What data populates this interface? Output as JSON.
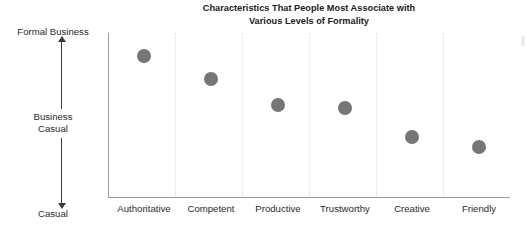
{
  "chart_data": {
    "type": "scatter",
    "title": "Characteristics That People Most Associate with\nVarious Levels of Formality",
    "xlabel": "",
    "ylabel": "",
    "categories": [
      "Authoritative",
      "Competent",
      "Productive",
      "Trustworthy",
      "Creative",
      "Friendly"
    ],
    "values": [
      0.855,
      0.715,
      0.558,
      0.54,
      0.364,
      0.303
    ],
    "y_axis": {
      "type": "ordinal-scale",
      "top_label": "Formal Business",
      "middle_label": "Business\nCasual",
      "bottom_label": "Casual",
      "ticks": [],
      "ylim": [
        0,
        1
      ]
    },
    "grid": {
      "vertical": true,
      "horizontal": false,
      "style": "dotted",
      "count": 5
    },
    "legend": {
      "visible": false,
      "position": "none"
    },
    "marker": {
      "shape": "circle",
      "color": "#767676",
      "size_px": 14
    },
    "series": [
      {
        "name": "Formality level",
        "points": [
          {
            "category": "Authoritative",
            "value": 0.855
          },
          {
            "category": "Competent",
            "value": 0.715
          },
          {
            "category": "Productive",
            "value": 0.558
          },
          {
            "category": "Trustworthy",
            "value": 0.54
          },
          {
            "category": "Creative",
            "value": 0.364
          },
          {
            "category": "Friendly",
            "value": 0.303
          }
        ]
      }
    ]
  },
  "colors": {
    "marker": "#767676",
    "axis": "#9a9a9a",
    "gridline": "#dcdcdc",
    "title_text": "#1b1b1b",
    "label_text": "#2a2a2a",
    "arrow": "#3b3b3b",
    "background": "#ffffff"
  }
}
